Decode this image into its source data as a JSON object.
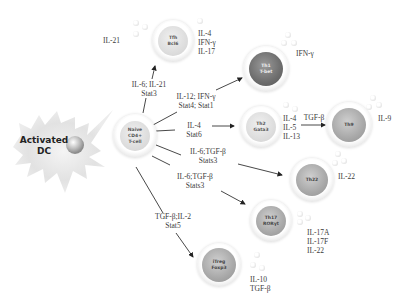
{
  "diagram": {
    "activated_dc": {
      "line1": "Activated",
      "line2": "DC"
    },
    "naive_cell": {
      "line1": "Naive",
      "line2": "CD4+",
      "line3": "T-cell"
    },
    "subsets": {
      "tfh": {
        "name": "Tfh",
        "tf": "Bcl6",
        "inducers": {
          "line1": "IL-6; IL-21",
          "line2": "Stat3"
        },
        "secreted_left": "IL-21",
        "secreted_right": [
          "IL-4",
          "IFN-γ",
          "IL-17"
        ]
      },
      "th1": {
        "name": "Th1",
        "tf": "T-bet",
        "inducers": {
          "line1": "IL-12; IFN-γ",
          "line2": "Stat4; Stat1"
        },
        "secreted": "IFN-γ"
      },
      "th2": {
        "name": "Th2",
        "tf": "Gata3",
        "inducers": {
          "line1": "IL-4",
          "line2": "Stat6"
        },
        "secreted": [
          "IL-4",
          "IL-5",
          "IL-13"
        ]
      },
      "th9": {
        "name": "Th9",
        "inducer": "TGF-β",
        "secreted": "IL-9"
      },
      "th22": {
        "name": "Th22",
        "inducers": {
          "line1": "IL-6;TGF-β",
          "line2": "Stats3"
        },
        "secreted": "IL-22"
      },
      "th17": {
        "name": "Th17",
        "tf": "RORγt",
        "inducers": {
          "line1": "IL-6;TGF-β",
          "line2": "Stats3"
        },
        "secreted": [
          "IL-17A",
          "IL-17F",
          "IL-22"
        ]
      },
      "treg": {
        "name": "iTreg",
        "tf": "Foxp3",
        "inducers": {
          "line1": "TGF-β;IL-2",
          "line2": "Stat5"
        },
        "secreted": [
          "IL-10",
          "TGF-β"
        ]
      }
    }
  }
}
